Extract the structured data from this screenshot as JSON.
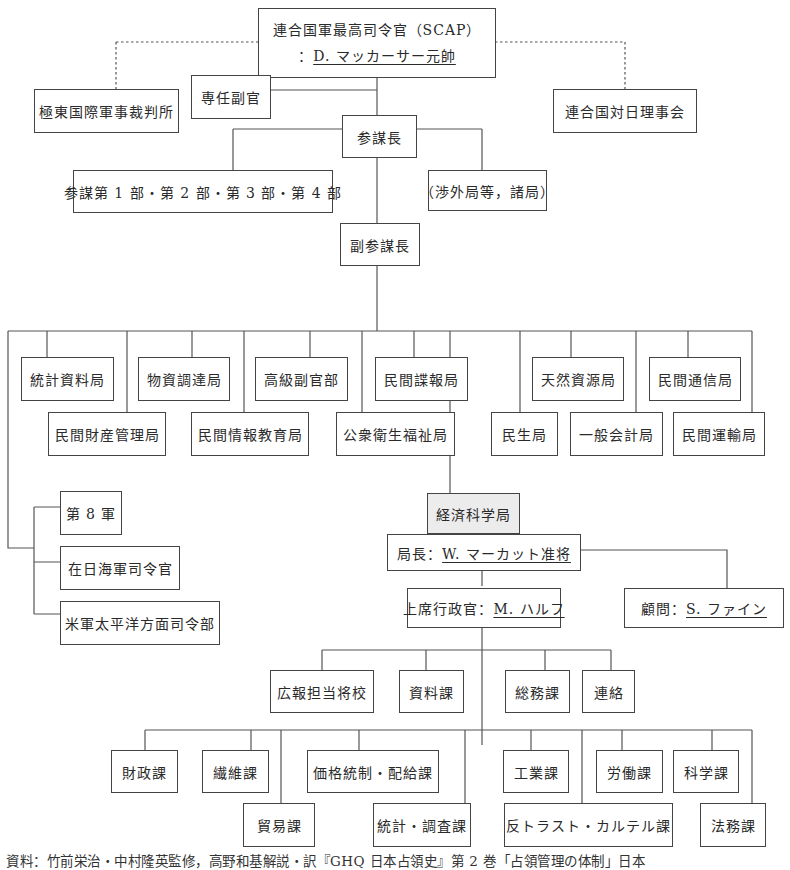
{
  "chart": {
    "top": {
      "line1": "連合国軍最高司令官（SCAP）",
      "line2_prefix": "：",
      "line2_name": "D. マッカーサー元帥"
    },
    "side_left": "極東国際軍事裁判所",
    "side_right": "連合国対日理事会",
    "special_adjutant": "専任副官",
    "chief_of_staff": "参謀長",
    "staff_sections": "参謀第 1 部・第 2 部・第 3 部・第 4 部",
    "other_bureaus": "（渉外局等，諸局）",
    "deputy_chief": "副参謀長",
    "bureaus": [
      {
        "id": "statistics",
        "label": "統計資料局"
      },
      {
        "id": "civil-property",
        "label": "民間財産管理局"
      },
      {
        "id": "procurement",
        "label": "物資調達局"
      },
      {
        "id": "civil-info-education",
        "label": "民間情報教育局"
      },
      {
        "id": "adjutant-general",
        "label": "高級副官部"
      },
      {
        "id": "public-health",
        "label": "公衆衛生福祉局"
      },
      {
        "id": "civil-intelligence",
        "label": "民間諜報局"
      },
      {
        "id": "government",
        "label": "民生局"
      },
      {
        "id": "natural-resources",
        "label": "天然資源局"
      },
      {
        "id": "general-accounting",
        "label": "一般会計局"
      },
      {
        "id": "civil-communications",
        "label": "民間通信局"
      },
      {
        "id": "civil-transport",
        "label": "民間運輸局"
      }
    ],
    "military": [
      {
        "id": "eighth-army",
        "label": "第 8 軍"
      },
      {
        "id": "naval-commander",
        "label": "在日海軍司令官"
      },
      {
        "id": "afpac",
        "label": "米軍太平洋方面司令部"
      }
    ],
    "esb": {
      "name": "経済科学局",
      "chief_prefix": "局長：",
      "chief_name": "W. マーカット准将",
      "exec_prefix": "上席行政官：",
      "exec_name": "M. ハルフ",
      "advisor_prefix": "顧問：",
      "advisor_name": "S. ファイン"
    },
    "esb_staff": [
      {
        "id": "pr-officer",
        "label": "広報担当将校"
      },
      {
        "id": "research",
        "label": "資料課"
      },
      {
        "id": "general-affairs",
        "label": "総務課"
      },
      {
        "id": "liaison",
        "label": "連絡"
      }
    ],
    "esb_divisions": [
      {
        "id": "finance",
        "label": "財政課"
      },
      {
        "id": "textile",
        "label": "繊維課"
      },
      {
        "id": "trade",
        "label": "貿易課"
      },
      {
        "id": "price-control",
        "label": "価格統制・配給課"
      },
      {
        "id": "statistics-research",
        "label": "統計・調査課"
      },
      {
        "id": "industry",
        "label": "工業課"
      },
      {
        "id": "antitrust",
        "label": "反トラスト・カルテル課"
      },
      {
        "id": "labor",
        "label": "労働課"
      },
      {
        "id": "science",
        "label": "科学課"
      },
      {
        "id": "legal",
        "label": "法務課"
      }
    ]
  },
  "footer": "資料：竹前栄治・中村隆英監修，高野和基解説・訳『GHQ 日本占領史』第 2 巻「占領管理の体制」日本"
}
